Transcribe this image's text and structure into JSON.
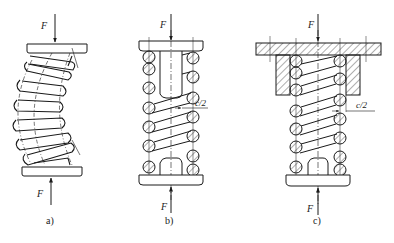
{
  "diagram": {
    "type": "engineering-drawing",
    "colors": {
      "line": "#1a1a1a",
      "background": "#ffffff",
      "hatch": "#333333"
    },
    "figures": [
      {
        "id": "a",
        "caption": "a)",
        "description": "Unsupported compression spring buckling sideways between two end plates",
        "force_top_label": "F",
        "force_bottom_label": "F",
        "coil_count": 8
      },
      {
        "id": "b",
        "caption": "b)",
        "description": "Compression spring guided by an internal guide rod (mandrel) with clearance",
        "force_top_label": "F",
        "force_bottom_label": "F",
        "clearance_label": "c/2"
      },
      {
        "id": "c",
        "caption": "c)",
        "description": "Compression spring guided by an external sleeve (bushing) with clearance",
        "force_top_label": "F",
        "force_bottom_label": "F",
        "clearance_label": "c/2"
      }
    ]
  }
}
